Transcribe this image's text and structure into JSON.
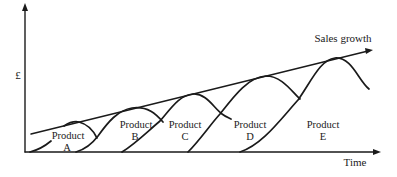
{
  "diagram": {
    "type": "product-life-cycle-sales-growth",
    "axes": {
      "y_label": "£",
      "x_label": "Time"
    },
    "trend_line": {
      "label": "Sales growth"
    },
    "products": [
      {
        "name": "Product",
        "letter": "A"
      },
      {
        "name": "Product",
        "letter": "B"
      },
      {
        "name": "Product",
        "letter": "C"
      },
      {
        "name": "Product",
        "letter": "D"
      },
      {
        "name": "Product",
        "letter": "E"
      }
    ],
    "colors": {
      "ink": "#1a1a1a",
      "background": "#ffffff"
    }
  }
}
